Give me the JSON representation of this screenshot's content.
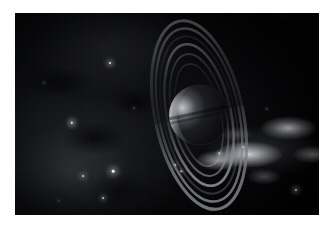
{
  "page": {
    "background_color": "#ffffff",
    "width": 332,
    "height": 231
  },
  "frame": {
    "name": "image-frame",
    "margin_color": "#ffffff",
    "x": 15,
    "y": 13,
    "width": 304,
    "height": 202
  },
  "scene": {
    "caption": "",
    "background_color": "#020203",
    "description": "Ringed gas giant planet with a crescent-lit limb set against a starfield and a bright nebula streak"
  },
  "planet": {
    "name": "ringed-planet",
    "body_color": "#0a0b0d",
    "lit_limb_color": "#b9bcc2",
    "terminator_color": "#2a2c31",
    "center_x": 62,
    "center_y": 100,
    "radius": 30
  },
  "rings": {
    "name": "ring-system",
    "band_color": "#8d9097",
    "gap_color": "#0a0b0d",
    "tilt_degrees": -12,
    "bands": [
      {
        "label": "outer-ring-a",
        "rx": 44,
        "ry": 96,
        "opacity": 0.62,
        "width": 3.0
      },
      {
        "label": "ring-a",
        "rx": 40,
        "ry": 88,
        "opacity": 0.55,
        "width": 2.4
      },
      {
        "label": "cassini-division",
        "rx": 36,
        "ry": 80,
        "opacity": 0.18,
        "width": 2.0
      },
      {
        "label": "ring-b",
        "rx": 32,
        "ry": 72,
        "opacity": 0.58,
        "width": 2.6
      },
      {
        "label": "ring-c",
        "rx": 27,
        "ry": 62,
        "opacity": 0.34,
        "width": 2.0
      },
      {
        "label": "inner-ring-d",
        "rx": 22,
        "ry": 52,
        "opacity": 0.2,
        "width": 1.6
      }
    ]
  },
  "nebula": {
    "name": "nebula-streak",
    "bright_color": "#eef0f3",
    "mid_color": "#9fa3ab",
    "haze_color": "#3c3f46",
    "position": "center-right"
  },
  "stars": [
    {
      "name": "star-1",
      "x": 95,
      "y": 50,
      "size": 2.0,
      "brightness": 0.95
    },
    {
      "name": "star-2",
      "x": 57,
      "y": 110,
      "size": 2.4,
      "brightness": 1.0
    },
    {
      "name": "star-3",
      "x": 98,
      "y": 158,
      "size": 2.6,
      "brightness": 1.0
    },
    {
      "name": "star-4",
      "x": 68,
      "y": 163,
      "size": 2.0,
      "brightness": 0.9
    },
    {
      "name": "star-5",
      "x": 88,
      "y": 185,
      "size": 1.8,
      "brightness": 0.85
    },
    {
      "name": "star-6",
      "x": 228,
      "y": 134,
      "size": 2.0,
      "brightness": 0.95
    },
    {
      "name": "star-7",
      "x": 281,
      "y": 177,
      "size": 2.2,
      "brightness": 0.95
    },
    {
      "name": "star-8",
      "x": 29,
      "y": 70,
      "size": 1.4,
      "brightness": 0.6
    },
    {
      "name": "star-9",
      "x": 160,
      "y": 152,
      "size": 1.8,
      "brightness": 0.8
    },
    {
      "name": "star-10",
      "x": 166,
      "y": 158,
      "size": 1.5,
      "brightness": 0.7
    },
    {
      "name": "star-11",
      "x": 204,
      "y": 140,
      "size": 1.5,
      "brightness": 0.7
    },
    {
      "name": "star-12",
      "x": 252,
      "y": 96,
      "size": 1.3,
      "brightness": 0.55
    },
    {
      "name": "star-13",
      "x": 44,
      "y": 188,
      "size": 1.3,
      "brightness": 0.55
    },
    {
      "name": "star-14",
      "x": 119,
      "y": 95,
      "size": 1.2,
      "brightness": 0.5
    },
    {
      "name": "star-15",
      "x": 189,
      "y": 118,
      "size": 1.2,
      "brightness": 0.45
    }
  ]
}
